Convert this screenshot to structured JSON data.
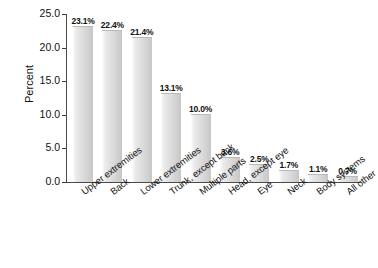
{
  "chart_data": {
    "type": "bar",
    "title": "",
    "xlabel": "",
    "ylabel": "Percent",
    "ylim": [
      0.0,
      25.0
    ],
    "yticks": [
      "0.0",
      "5.0",
      "10.0",
      "15.0",
      "20.0",
      "25.0"
    ],
    "ytick_values": [
      0.0,
      5.0,
      10.0,
      15.0,
      20.0,
      25.0
    ],
    "grid": false,
    "legend": "none",
    "categories": [
      "Upper extremities",
      "Back",
      "Lower extremities",
      "Trunk, except back",
      "Multiple parts",
      "Head, except eye",
      "Eye",
      "Neck",
      "Body systems",
      "All other"
    ],
    "values": [
      23.1,
      22.4,
      21.4,
      13.1,
      10.0,
      3.6,
      2.5,
      1.7,
      1.1,
      0.7
    ],
    "data_labels": [
      "23.1%",
      "22.4%",
      "21.4%",
      "13.1%",
      "10.0%",
      "3.6%",
      "2.5%",
      "1.7%",
      "1.1%",
      "0.7%"
    ]
  },
  "colors": {
    "bar_light": "#fdfdfd",
    "bar_mid": "#dcdcdc",
    "bar_dark": "#c6c6c6",
    "axis": "#4a4a4a",
    "text": "#111111",
    "background": "#ffffff"
  }
}
